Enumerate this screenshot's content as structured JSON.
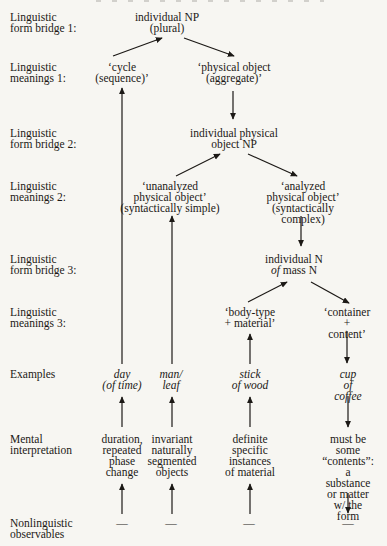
{
  "row_labels": {
    "form_bridge_1": "Linguistic\nform bridge 1:",
    "meanings_1": "Linguistic\nmeanings 1:",
    "form_bridge_2": "Linguistic\nform bridge 2:",
    "meanings_2": "Linguistic\nmeanings 2:",
    "form_bridge_3": "Linguistic\nform bridge 3:",
    "meanings_3": "Linguistic\nmeanings 3:",
    "examples": "Examples",
    "mental_interpretation": "Mental\ninterpretation",
    "nonlinguistic_observables": "Nonlinguistic\nobservables"
  },
  "nodes": {
    "form_bridge_1": "individual NP\n(plural)",
    "meaning_cycle": "‘cycle\n(sequence)’",
    "meaning_physical_object": "‘physical object\n(aggregate)’",
    "form_bridge_2": "individual physical\nobject NP",
    "meaning_unanalyzed": "‘unanalyzed\nphysical object’\n(syntactically simple)",
    "meaning_analyzed": "‘analyzed\nphysical object’\n(syntactically complex)",
    "form_bridge_3": {
      "line1": "individual N",
      "of": "of",
      "rest": " mass N"
    },
    "meaning_body_type": "‘body-type\n+ material’",
    "meaning_container": "‘container\n+ content’"
  },
  "examples": [
    "day\n(of time)",
    "man/\nleaf",
    "stick\nof wood",
    "cup\nof coffee"
  ],
  "mental_interpretations": [
    "duration,\nrepeated\nphase\nchange",
    "invariant\nnaturally\nsegmented\nobjects",
    "definite\nspecific\ninstances\nof material",
    "must be some\n“contents”:\na substance\nor matter\nw/ the form"
  ],
  "observables": [
    "—",
    "—",
    "—",
    "—"
  ]
}
